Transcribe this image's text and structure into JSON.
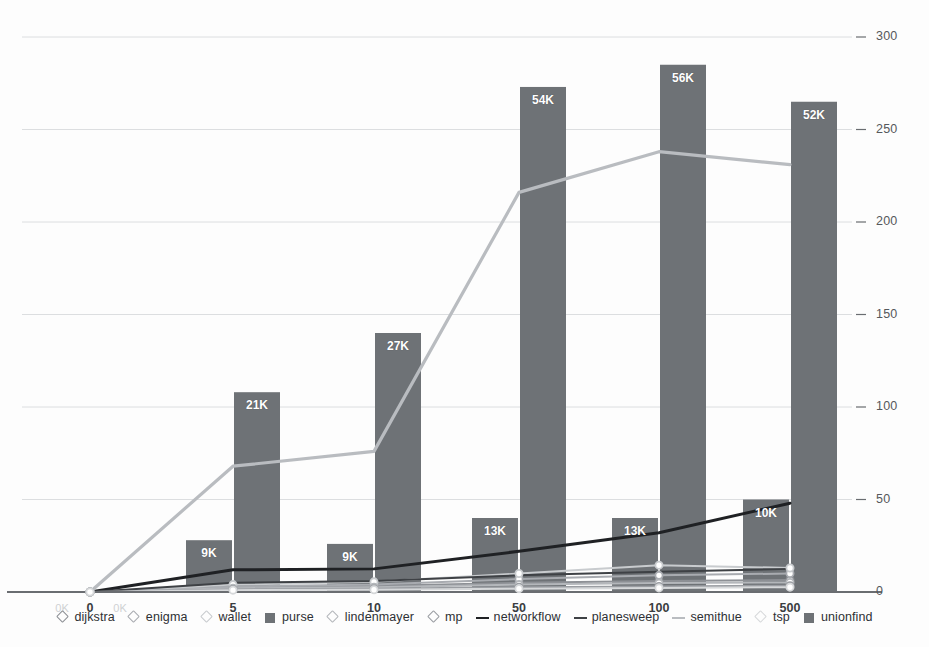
{
  "chart_data": {
    "type": "line",
    "title": "",
    "subtitle": "",
    "xlabel": "",
    "ylabel": "",
    "grid": true,
    "legend_position": "bottom",
    "x": [
      "0",
      "5",
      "10",
      "50",
      "100",
      "500"
    ],
    "x_categories_ghost": [
      "0K",
      "0K"
    ],
    "ylim": [
      0,
      300
    ],
    "yticks": [
      "0",
      "50",
      "100",
      "150",
      "200",
      "250",
      "300"
    ],
    "ytick_values": [
      0,
      50,
      100,
      150,
      200,
      250,
      300
    ],
    "bar_value_labels": {
      "purse": [
        "",
        "9K",
        "9K",
        "13K",
        "13K",
        "10K"
      ],
      "unionfind": [
        "",
        "21K",
        "27K",
        "54K",
        "56K",
        "52K"
      ]
    },
    "series": [
      {
        "name": "dijkstra",
        "kind": "line",
        "marker": "diamond",
        "color": "#8d9095",
        "values": [
          0,
          2.5,
          3.2,
          5.0,
          6.0,
          6.5
        ]
      },
      {
        "name": "enigma",
        "kind": "line",
        "marker": "diamond",
        "color": "#a8abb0",
        "values": [
          0,
          3.0,
          4.0,
          7.0,
          9.0,
          10.0
        ]
      },
      {
        "name": "wallet",
        "kind": "line",
        "marker": "diamond",
        "color": "#c8cbce",
        "values": [
          0,
          4.0,
          5.5,
          10.0,
          14.5,
          13.0
        ]
      },
      {
        "name": "purse",
        "kind": "bar",
        "marker": "square",
        "color": "#6e7276",
        "values": [
          0,
          28,
          26,
          40,
          40,
          50
        ]
      },
      {
        "name": "lindenmayer",
        "kind": "line",
        "marker": "diamond",
        "color": "#b4b7bb",
        "values": [
          0,
          2.0,
          2.6,
          4.0,
          4.8,
          5.2
        ]
      },
      {
        "name": "mp",
        "kind": "line",
        "marker": "diamond",
        "color": "#9a9da2",
        "values": [
          0,
          1.4,
          1.8,
          2.6,
          3.0,
          3.4
        ]
      },
      {
        "name": "networkflow",
        "kind": "line",
        "marker": "line",
        "color": "#1f2124",
        "values": [
          0,
          12.0,
          12.5,
          22.0,
          32.0,
          48.0
        ]
      },
      {
        "name": "planesweep",
        "kind": "line",
        "marker": "line",
        "color": "#3e4145",
        "values": [
          0,
          5.0,
          6.0,
          9.0,
          11.0,
          12.5
        ]
      },
      {
        "name": "semithue",
        "kind": "line",
        "marker": "line",
        "color": "#b9bcc0",
        "values": [
          0,
          68,
          76,
          216,
          238,
          231
        ]
      },
      {
        "name": "tsp",
        "kind": "line",
        "marker": "diamond",
        "color": "#d6d8da",
        "values": [
          0,
          1.0,
          1.2,
          1.8,
          2.2,
          2.6
        ]
      },
      {
        "name": "unionfind",
        "kind": "bar",
        "marker": "square",
        "color": "#6e7276",
        "values": [
          0,
          108,
          140,
          273,
          285,
          265
        ]
      }
    ],
    "colors": {
      "grid": "#dcdee0",
      "axis": "#6a6d71",
      "bar": "#6e7276",
      "bar_label_text": "#ffffff",
      "highlight_line": "#b9bcc0",
      "dark_line": "#1f2124",
      "background": "#fdfdfd"
    }
  }
}
